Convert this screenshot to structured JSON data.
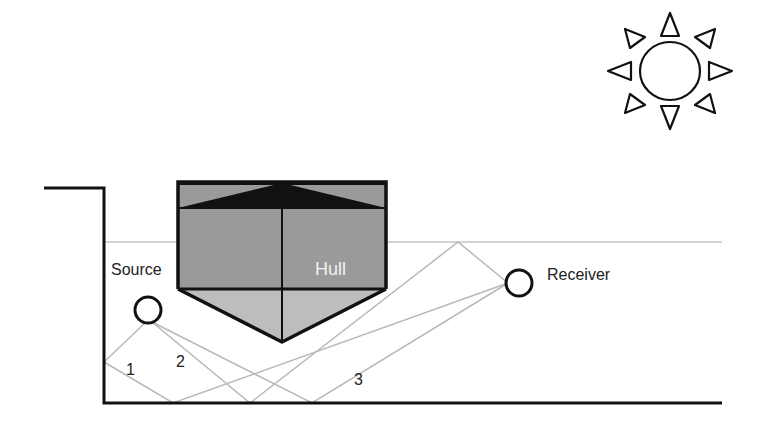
{
  "diagram": {
    "title": "",
    "labels": {
      "source": "Source",
      "receiver": "Receiver",
      "hull": "Hull"
    },
    "paths": [
      {
        "id": "1",
        "label": "1",
        "description": "source -> tank wall -> floor -> receiver"
      },
      {
        "id": "2",
        "label": "2",
        "description": "source -> floor -> water surface -> receiver"
      },
      {
        "id": "3",
        "label": "3",
        "description": "source -> floor -> receiver"
      }
    ],
    "icons": {
      "sun": "sun-icon"
    },
    "colors": {
      "outline": "#111111",
      "hull_upper": "#9a9a9a",
      "hull_lower": "#bdbdbd",
      "ray": "#b5b5b5",
      "water_surface": "#bdbdbd"
    }
  }
}
